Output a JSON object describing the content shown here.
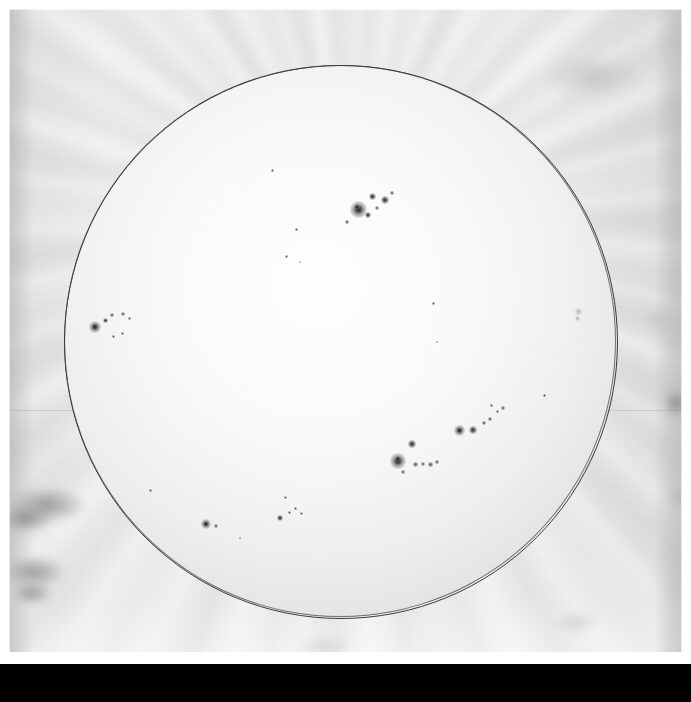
{
  "image": {
    "kind": "solar-photographic-plate-scan",
    "subject": "Solar disk with sunspot groups",
    "orientation": "positive grayscale scan of glass plate",
    "width_px": 691,
    "height_px": 702
  },
  "frame": {
    "paper_margin_color": "#ffffff",
    "emulsion_base_color": "#e9e9e9",
    "black_band": {
      "top_px": 664,
      "height_px": 38,
      "color": "#000000"
    },
    "seam_line": {
      "y_px": 410,
      "color": "#969696"
    }
  },
  "disk": {
    "label": "solar-disk",
    "center_x_px": 340,
    "center_y_px": 341,
    "radius_px": 276,
    "limb_color": "#3a3a3c",
    "core_color": "#fefefe",
    "limb_darkening_color": "#c4c4c4"
  },
  "sunspot_groups": [
    {
      "name": "north-central-group",
      "spots": [
        {
          "x": 358,
          "y": 209,
          "size": 17,
          "style": "penumbral"
        },
        {
          "x": 357,
          "y": 207,
          "size": 6,
          "style": "spot"
        },
        {
          "x": 372,
          "y": 196,
          "size": 7,
          "style": "spot"
        },
        {
          "x": 385,
          "y": 200,
          "size": 8,
          "style": "spot"
        },
        {
          "x": 368,
          "y": 215,
          "size": 6,
          "style": "spot"
        },
        {
          "x": 377,
          "y": 208,
          "size": 4,
          "style": "tiny"
        },
        {
          "x": 392,
          "y": 193,
          "size": 4,
          "style": "tiny"
        },
        {
          "x": 347,
          "y": 222,
          "size": 4,
          "style": "tiny"
        }
      ]
    },
    {
      "name": "east-limb-group",
      "spots": [
        {
          "x": 95,
          "y": 327,
          "size": 12,
          "style": "penumbral"
        },
        {
          "x": 105,
          "y": 320,
          "size": 5,
          "style": "spot"
        },
        {
          "x": 112,
          "y": 315,
          "size": 4,
          "style": "tiny"
        },
        {
          "x": 123,
          "y": 314,
          "size": 4,
          "style": "tiny"
        },
        {
          "x": 129,
          "y": 318,
          "size": 3,
          "style": "tiny"
        },
        {
          "x": 113,
          "y": 336,
          "size": 3,
          "style": "tiny"
        },
        {
          "x": 122,
          "y": 333,
          "size": 3,
          "style": "tiny"
        }
      ]
    },
    {
      "name": "southwest-chain-main",
      "spots": [
        {
          "x": 398,
          "y": 461,
          "size": 16,
          "style": "penumbral"
        },
        {
          "x": 398,
          "y": 459,
          "size": 6,
          "style": "spot"
        },
        {
          "x": 412,
          "y": 444,
          "size": 8,
          "style": "spot"
        },
        {
          "x": 415,
          "y": 464,
          "size": 5,
          "style": "tiny"
        },
        {
          "x": 423,
          "y": 464,
          "size": 4,
          "style": "tiny"
        },
        {
          "x": 430,
          "y": 464,
          "size": 5,
          "style": "tiny"
        },
        {
          "x": 437,
          "y": 462,
          "size": 4,
          "style": "tiny"
        },
        {
          "x": 403,
          "y": 472,
          "size": 4,
          "style": "tiny"
        }
      ]
    },
    {
      "name": "southwest-chain-outer",
      "spots": [
        {
          "x": 459,
          "y": 430,
          "size": 11,
          "style": "penumbral"
        },
        {
          "x": 473,
          "y": 430,
          "size": 8,
          "style": "spot"
        },
        {
          "x": 484,
          "y": 423,
          "size": 4,
          "style": "tiny"
        },
        {
          "x": 490,
          "y": 419,
          "size": 4,
          "style": "tiny"
        },
        {
          "x": 497,
          "y": 411,
          "size": 3,
          "style": "tiny"
        },
        {
          "x": 503,
          "y": 408,
          "size": 4,
          "style": "tiny"
        },
        {
          "x": 491,
          "y": 405,
          "size": 3,
          "style": "tiny"
        }
      ]
    },
    {
      "name": "south-group",
      "spots": [
        {
          "x": 206,
          "y": 524,
          "size": 10,
          "style": "penumbral"
        },
        {
          "x": 216,
          "y": 526,
          "size": 4,
          "style": "tiny"
        },
        {
          "x": 280,
          "y": 518,
          "size": 6,
          "style": "spot"
        },
        {
          "x": 289,
          "y": 512,
          "size": 3,
          "style": "tiny"
        },
        {
          "x": 295,
          "y": 508,
          "size": 3,
          "style": "tiny"
        },
        {
          "x": 301,
          "y": 513,
          "size": 3,
          "style": "tiny"
        }
      ]
    },
    {
      "name": "west-limb-spot",
      "spots": [
        {
          "x": 578,
          "y": 311,
          "size": 7,
          "style": "faint"
        },
        {
          "x": 577,
          "y": 318,
          "size": 5,
          "style": "faint"
        }
      ]
    },
    {
      "name": "scattered-pores",
      "spots": [
        {
          "x": 272,
          "y": 170,
          "size": 3,
          "style": "tiny"
        },
        {
          "x": 296,
          "y": 229,
          "size": 3,
          "style": "tiny"
        },
        {
          "x": 286,
          "y": 256,
          "size": 3,
          "style": "tiny"
        },
        {
          "x": 300,
          "y": 262,
          "size": 2,
          "style": "tiny"
        },
        {
          "x": 433,
          "y": 303,
          "size": 3,
          "style": "tiny"
        },
        {
          "x": 437,
          "y": 342,
          "size": 2,
          "style": "tiny"
        },
        {
          "x": 544,
          "y": 395,
          "size": 3,
          "style": "tiny"
        },
        {
          "x": 150,
          "y": 490,
          "size": 3,
          "style": "tiny"
        },
        {
          "x": 285,
          "y": 497,
          "size": 3,
          "style": "tiny"
        },
        {
          "x": 240,
          "y": 538,
          "size": 2,
          "style": "tiny"
        }
      ]
    }
  ],
  "plate_defects": [
    {
      "name": "lower-left-smudge-upper",
      "x": 10,
      "y": 488,
      "w": 74,
      "h": 34,
      "style": "smudge"
    },
    {
      "name": "lower-left-smudge-mid",
      "x": 0,
      "y": 506,
      "w": 52,
      "h": 26,
      "style": "smudge"
    },
    {
      "name": "lower-left-smudge-lower",
      "x": 4,
      "y": 556,
      "w": 60,
      "h": 32,
      "style": "smudge"
    },
    {
      "name": "lower-left-smudge-tail",
      "x": 12,
      "y": 582,
      "w": 40,
      "h": 22,
      "style": "smudge"
    },
    {
      "name": "right-edge-smudge-top",
      "x": 646,
      "y": 312,
      "w": 22,
      "h": 16,
      "style": "light"
    },
    {
      "name": "right-edge-smudge-mid",
      "x": 664,
      "y": 390,
      "w": 24,
      "h": 26,
      "style": "smudge"
    },
    {
      "name": "right-edge-smudge-low",
      "x": 668,
      "y": 488,
      "w": 22,
      "h": 20,
      "style": "light"
    },
    {
      "name": "bottom-smudge-right",
      "x": 556,
      "y": 614,
      "w": 40,
      "h": 16,
      "style": "light"
    },
    {
      "name": "bottom-smudge-center",
      "x": 300,
      "y": 640,
      "w": 52,
      "h": 12,
      "style": "light"
    },
    {
      "name": "top-right-haze",
      "x": 548,
      "y": 56,
      "w": 90,
      "h": 40,
      "style": "light"
    }
  ],
  "colors": {
    "background": "#000000",
    "paper": "#ffffff",
    "emulsion": "#e9e9e9",
    "disk_core": "#fefefe",
    "disk_limb": "#c4c4c4",
    "limb_line": "#3a3a3c",
    "spot_umbra": "#191919"
  }
}
